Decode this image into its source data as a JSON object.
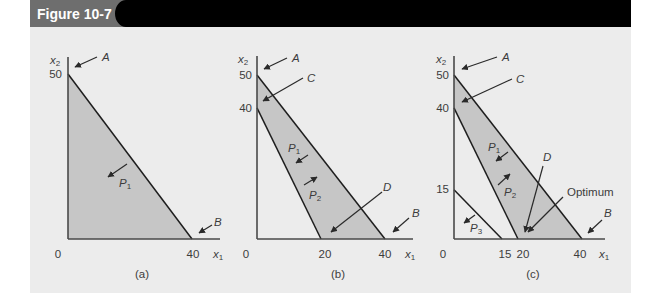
{
  "header": {
    "figure_label": "Figure 10-7"
  },
  "colors": {
    "header_tab": "#6e6e6e",
    "header_bar": "#000000",
    "panel_background": "#ececec",
    "feasible_region": "#c6c6c6",
    "lines": "#1e1e1e"
  },
  "panels": [
    {
      "caption": "(a)",
      "axes": {
        "x_label": {
          "base": "x",
          "sub": "1"
        },
        "y_label": {
          "base": "x",
          "sub": "2"
        },
        "origin": "0",
        "x_ticks": [
          "40"
        ],
        "y_ticks": [
          "50"
        ]
      },
      "annotations": {
        "A": "A",
        "B": "B",
        "P1": {
          "base": "P",
          "sub": "1"
        }
      }
    },
    {
      "caption": "(b)",
      "axes": {
        "x_label": {
          "base": "x",
          "sub": "1"
        },
        "y_label": {
          "base": "x",
          "sub": "2"
        },
        "origin": "0",
        "x_ticks": [
          "20",
          "40"
        ],
        "y_ticks": [
          "50",
          "40"
        ]
      },
      "annotations": {
        "A": "A",
        "C": "C",
        "D": "D",
        "B": "B",
        "P1": {
          "base": "P",
          "sub": "1"
        },
        "P2": {
          "base": "P",
          "sub": "2"
        }
      }
    },
    {
      "caption": "(c)",
      "axes": {
        "x_label": {
          "base": "x",
          "sub": "1"
        },
        "y_label": {
          "base": "x",
          "sub": "2"
        },
        "origin": "0",
        "x_ticks": [
          "15",
          "20",
          "40"
        ],
        "y_ticks": [
          "50",
          "40",
          "15"
        ]
      },
      "annotations": {
        "A": "A",
        "C": "C",
        "D": "D",
        "B": "B",
        "optimum": "Optimum",
        "P1": {
          "base": "P",
          "sub": "1"
        },
        "P2": {
          "base": "P",
          "sub": "2"
        },
        "P3": {
          "base": "P",
          "sub": "3"
        }
      }
    }
  ],
  "chart_data": [
    {
      "type": "area",
      "title": "(a)",
      "xlabel": "x1",
      "ylabel": "x2",
      "xlim": [
        0,
        45
      ],
      "ylim": [
        0,
        55
      ],
      "grid": false,
      "x_ticks": [
        0,
        40
      ],
      "y_ticks": [
        50
      ],
      "lines": [
        {
          "name": "P1 constraint",
          "from": [
            0,
            50
          ],
          "to": [
            40,
            0
          ]
        }
      ],
      "feasible_region": [
        [
          0,
          0
        ],
        [
          0,
          50
        ],
        [
          40,
          0
        ]
      ],
      "annotations": [
        {
          "text": "A",
          "points_to": [
            0,
            50
          ]
        },
        {
          "text": "B",
          "points_to": [
            40,
            0
          ]
        },
        {
          "text": "P1",
          "arrow": "toward origin (feasible side of P1)"
        }
      ]
    },
    {
      "type": "area",
      "title": "(b)",
      "xlabel": "x1",
      "ylabel": "x2",
      "xlim": [
        0,
        45
      ],
      "ylim": [
        0,
        55
      ],
      "grid": false,
      "x_ticks": [
        0,
        20,
        40
      ],
      "y_ticks": [
        40,
        50
      ],
      "lines": [
        {
          "name": "P1 constraint",
          "from": [
            0,
            50
          ],
          "to": [
            40,
            0
          ]
        },
        {
          "name": "P2 constraint",
          "from": [
            0,
            40
          ],
          "to": [
            20,
            0
          ]
        }
      ],
      "feasible_region": [
        [
          0,
          50
        ],
        [
          40,
          0
        ],
        [
          20,
          0
        ],
        [
          0,
          40
        ]
      ],
      "annotations": [
        {
          "text": "A",
          "points_to": [
            0,
            50
          ]
        },
        {
          "text": "C",
          "points_to": [
            0,
            43
          ]
        },
        {
          "text": "D",
          "points_to": [
            22,
            2
          ]
        },
        {
          "text": "B",
          "points_to": [
            40,
            0
          ]
        },
        {
          "text": "P1",
          "arrow": "toward origin"
        },
        {
          "text": "P2",
          "arrow": "away from origin"
        }
      ]
    },
    {
      "type": "area",
      "title": "(c)",
      "xlabel": "x1",
      "ylabel": "x2",
      "xlim": [
        0,
        45
      ],
      "ylim": [
        0,
        55
      ],
      "grid": false,
      "x_ticks": [
        0,
        15,
        20,
        40
      ],
      "y_ticks": [
        15,
        40,
        50
      ],
      "lines": [
        {
          "name": "P1 constraint",
          "from": [
            0,
            50
          ],
          "to": [
            40,
            0
          ]
        },
        {
          "name": "P2 constraint",
          "from": [
            0,
            40
          ],
          "to": [
            20,
            0
          ]
        },
        {
          "name": "P3 constraint",
          "from": [
            0,
            15
          ],
          "to": [
            15,
            0
          ]
        }
      ],
      "feasible_region": [
        [
          0,
          50
        ],
        [
          40,
          0
        ],
        [
          20,
          0
        ],
        [
          0,
          40
        ]
      ],
      "annotations": [
        {
          "text": "A",
          "points_to": [
            0,
            50
          ]
        },
        {
          "text": "C",
          "points_to": [
            0,
            43
          ]
        },
        {
          "text": "D",
          "points_to": [
            20,
            2
          ]
        },
        {
          "text": "Optimum",
          "points_to": [
            20,
            0
          ]
        },
        {
          "text": "B",
          "points_to": [
            40,
            0
          ]
        },
        {
          "text": "P1",
          "arrow": "toward origin"
        },
        {
          "text": "P2",
          "arrow": "away from origin"
        },
        {
          "text": "P3",
          "arrow": "toward origin"
        }
      ]
    }
  ]
}
